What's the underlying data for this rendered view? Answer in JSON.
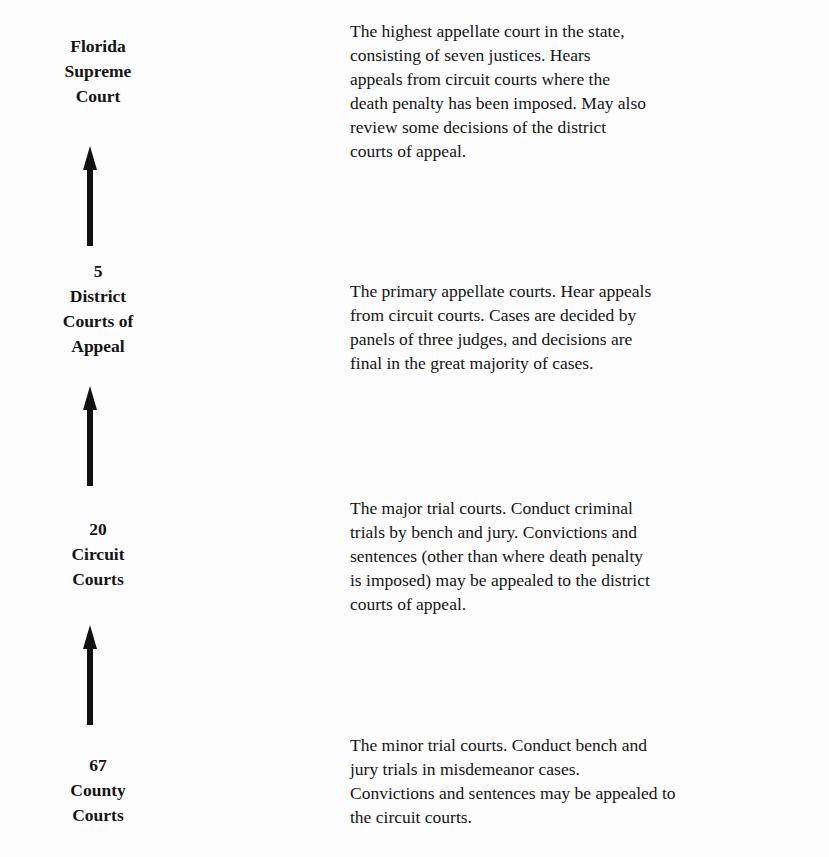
{
  "diagram": {
    "levels": [
      {
        "id": "supreme",
        "label_lines": [
          "Florida",
          "Supreme",
          "Court"
        ],
        "description_lines": [
          "The highest appellate court in the state,",
          "consisting of seven justices.  Hears",
          "appeals from circuit courts where the",
          "death penalty has been imposed.  May also",
          "review some decisions of the district",
          "courts of appeal."
        ]
      },
      {
        "id": "district",
        "label_lines": [
          "5",
          "District",
          "Courts of",
          "Appeal"
        ],
        "description_lines": [
          "The primary appellate courts.  Hear appeals",
          "from circuit courts.  Cases are decided by",
          "panels of three judges, and decisions are",
          "final in the great majority of cases."
        ]
      },
      {
        "id": "circuit",
        "label_lines": [
          "20",
          "Circuit",
          "Courts"
        ],
        "description_lines": [
          "The major trial courts.  Conduct criminal",
          "trials by bench and jury.  Convictions and",
          "sentences (other than where death penalty",
          "is imposed) may be appealed to the district",
          "courts of appeal."
        ]
      },
      {
        "id": "county",
        "label_lines": [
          "67",
          "County",
          "Courts"
        ],
        "description_lines": [
          "The minor trial courts.  Conduct bench and",
          "jury trials in misdemeanor cases.",
          "Convictions and sentences may be appealed to",
          "the circuit courts."
        ]
      }
    ],
    "arrows": [
      {
        "from": "district",
        "to": "supreme",
        "icon": "arrow-up-icon"
      },
      {
        "from": "circuit",
        "to": "district",
        "icon": "arrow-up-icon"
      },
      {
        "from": "county",
        "to": "circuit",
        "icon": "arrow-up-icon"
      }
    ],
    "colors": {
      "text": "#141414",
      "arrow": "#111111",
      "background": "#fdfdfd"
    }
  }
}
